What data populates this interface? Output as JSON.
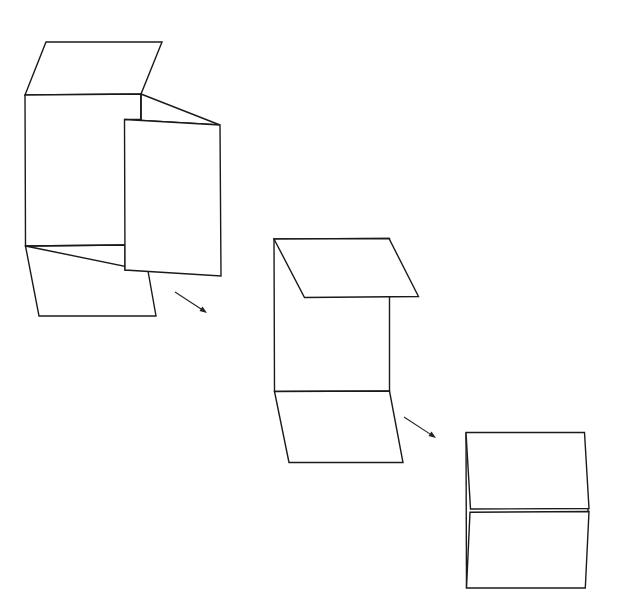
{
  "diagram": {
    "title": "",
    "colors": {
      "line": "#1a1a1a",
      "background": "#ffffff"
    },
    "steps": [
      {
        "id": "step-1",
        "label": "",
        "parts": [
          "top-flap",
          "main-panel",
          "side-flap-fold",
          "right-panel-open",
          "bottom-flap"
        ]
      },
      {
        "id": "step-2",
        "label": "",
        "parts": [
          "top-flap-folded",
          "main-panel",
          "bottom-flap"
        ]
      },
      {
        "id": "step-3",
        "label": "",
        "parts": [
          "upper-panel",
          "lower-panel"
        ]
      }
    ],
    "arrows": [
      {
        "from": "step-1",
        "to": "step-2",
        "direction": "down-right"
      },
      {
        "from": "step-2",
        "to": "step-3",
        "direction": "down-right"
      }
    ]
  }
}
